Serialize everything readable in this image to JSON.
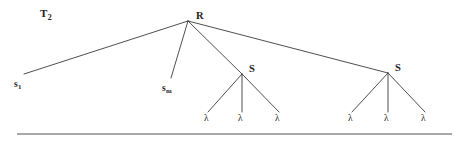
{
  "figure": {
    "caption_label": "T",
    "caption_subscript": "2",
    "background_color": "#ffffff",
    "edge_color": "#3a3a3a",
    "text_color": "#1d1d1d",
    "rule_color": "#8c8c8c",
    "width": 455,
    "height": 143
  },
  "nodes": {
    "root": {
      "id": "R",
      "label": "R",
      "x": 188,
      "y": 21,
      "label_x": 196,
      "label_y": 11
    },
    "subtree_left": {
      "id": "S1",
      "label": "S",
      "x": 242,
      "y": 74,
      "label_x": 249,
      "label_y": 64
    },
    "subtree_right": {
      "id": "S2",
      "label": "S",
      "x": 388,
      "y": 73,
      "label_x": 395,
      "label_y": 63
    }
  },
  "leaf_labels": {
    "s_first_base": "s",
    "s_first_subscript": "1",
    "s_last_base": "s",
    "s_last_subscript": "m",
    "lambda": "λ"
  },
  "leaves": {
    "s_first": {
      "base": "s",
      "subscript": "1",
      "edge_end_x": 24,
      "edge_end_y": 74,
      "label_x": 14,
      "label_y": 80
    },
    "s_last": {
      "base": "s",
      "subscript": "m",
      "edge_end_x": 171,
      "edge_end_y": 78,
      "label_x": 162,
      "label_y": 84
    },
    "lambdas_left": [
      {
        "label": "λ",
        "edge_end_x": 208,
        "edge_end_y": 112,
        "label_x": 204,
        "label_y": 114
      },
      {
        "label": "λ",
        "edge_end_x": 242,
        "edge_end_y": 112,
        "label_x": 238,
        "label_y": 114
      },
      {
        "label": "λ",
        "edge_end_x": 279,
        "edge_end_y": 112,
        "label_x": 275,
        "label_y": 114
      }
    ],
    "lambdas_right": [
      {
        "label": "λ",
        "edge_end_x": 352,
        "edge_end_y": 112,
        "label_x": 348,
        "label_y": 114
      },
      {
        "label": "λ",
        "edge_end_x": 388,
        "edge_end_y": 112,
        "label_x": 384,
        "label_y": 114
      },
      {
        "label": "λ",
        "edge_end_x": 425,
        "edge_end_y": 112,
        "label_x": 421,
        "label_y": 114
      }
    ]
  },
  "edges": [
    {
      "name": "root-to-s-first",
      "x1": 188,
      "y1": 21,
      "x2": 24,
      "y2": 74
    },
    {
      "name": "root-to-s-last",
      "x1": 188,
      "y1": 21,
      "x2": 171,
      "y2": 78
    },
    {
      "name": "root-to-subtree-left",
      "x1": 188,
      "y1": 21,
      "x2": 242,
      "y2": 74
    },
    {
      "name": "root-to-subtree-right",
      "x1": 188,
      "y1": 21,
      "x2": 388,
      "y2": 73
    },
    {
      "name": "subtree-left-to-lambda-1",
      "x1": 242,
      "y1": 74,
      "x2": 208,
      "y2": 112
    },
    {
      "name": "subtree-left-to-lambda-2",
      "x1": 242,
      "y1": 74,
      "x2": 242,
      "y2": 112
    },
    {
      "name": "subtree-left-to-lambda-3",
      "x1": 242,
      "y1": 74,
      "x2": 279,
      "y2": 112
    },
    {
      "name": "subtree-right-to-lambda-1",
      "x1": 388,
      "y1": 73,
      "x2": 352,
      "y2": 112
    },
    {
      "name": "subtree-right-to-lambda-2",
      "x1": 388,
      "y1": 73,
      "x2": 388,
      "y2": 112
    },
    {
      "name": "subtree-right-to-lambda-3",
      "x1": 388,
      "y1": 73,
      "x2": 425,
      "y2": 112
    }
  ],
  "baseline_rule": {
    "x1": 17,
    "y1": 134,
    "x2": 452,
    "y2": 134
  },
  "caption_position": {
    "x": 40,
    "y": 8
  }
}
